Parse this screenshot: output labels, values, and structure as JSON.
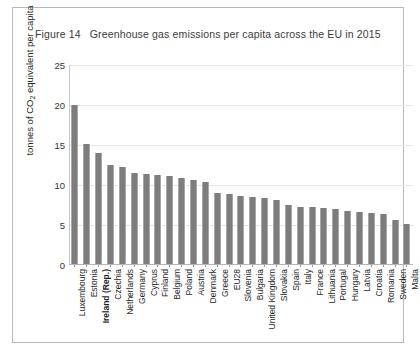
{
  "figure": {
    "number": "Figure 14",
    "title": "Greenhouse gas emissions per capita across the EU in 2015"
  },
  "chart_data": {
    "type": "bar",
    "title": "Greenhouse gas emissions per capita across the EU in 2015",
    "xlabel": "",
    "ylabel": "tonnes of CO2 equivalent per capita",
    "ylabel_rich": "tonnes of CO₂ equivalent per capita",
    "ylim": [
      0,
      25
    ],
    "yticks": [
      0,
      5,
      10,
      15,
      20,
      25
    ],
    "grid": true,
    "legend": "none",
    "bar_color": "#7d7d7d",
    "highlight_category": "Ireland (Rep.)",
    "categories": [
      "Luxembourg",
      "Estonia",
      "Ireland (Rep.)",
      "Czechia",
      "Netherlands",
      "Germany",
      "Cyprus",
      "Finland",
      "Belgium",
      "Poland",
      "Austria",
      "Denmark",
      "Greece",
      "EU28",
      "Slovenia",
      "Bulgaria",
      "United Kingdom",
      "Slovakia",
      "Spain",
      "Italy",
      "France",
      "Lithuania",
      "Portugal",
      "Hungary",
      "Latvia",
      "Croatia",
      "Romania",
      "Sweden",
      "Malta"
    ],
    "values": [
      20.0,
      15.1,
      13.9,
      12.5,
      12.2,
      11.4,
      11.3,
      11.2,
      11.0,
      10.8,
      10.6,
      10.3,
      8.9,
      8.8,
      8.6,
      8.4,
      8.3,
      8.0,
      7.4,
      7.2,
      7.1,
      7.0,
      6.9,
      6.7,
      6.5,
      6.4,
      6.3,
      5.5,
      5.0
    ]
  }
}
